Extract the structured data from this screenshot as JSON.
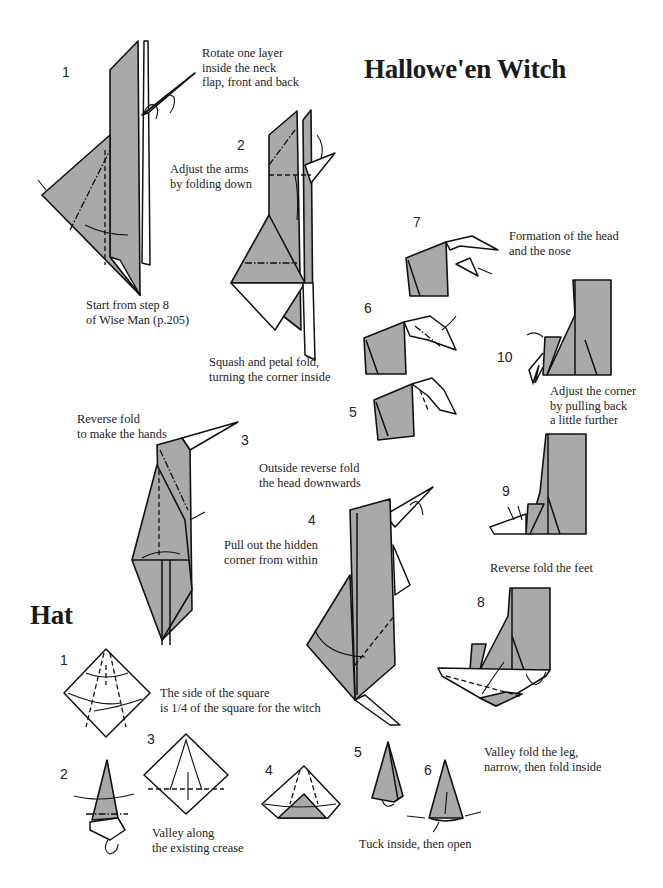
{
  "page": {
    "title": "Hallowe'en Witch",
    "accent_gray": "#a9a9a9",
    "line_color": "#111111"
  },
  "witch": {
    "steps": [
      {
        "number": "1",
        "caption": "Rotate one layer\ninside the neck\nflap, front and back"
      },
      {
        "number": "2",
        "caption": "Adjust the arms\nby folding down"
      },
      {
        "number": "3",
        "caption": "Reverse fold\nto make the hands"
      },
      {
        "number": "4",
        "caption": "Outside reverse fold\nthe head downwards"
      },
      {
        "number": "5",
        "caption": ""
      },
      {
        "number": "6",
        "caption": ""
      },
      {
        "number": "7",
        "caption": "Formation of the head\nand the nose"
      },
      {
        "number": "8",
        "caption": "Valley fold the leg,\nnarrow, then fold inside"
      },
      {
        "number": "9",
        "caption": "Reverse fold the feet"
      },
      {
        "number": "10",
        "caption": "Adjust the corner\nby pulling back\na little further"
      }
    ],
    "notes": {
      "start": "Start from step 8\nof Wise Man (p.205)",
      "squash": "Squash and petal fold,\nturning the corner inside",
      "pull_out": "Pull out the hidden\ncorner from within"
    }
  },
  "hat": {
    "title": "Hat",
    "steps": [
      {
        "number": "1",
        "caption": "The side of the square\nis 1/4 of the square for the witch"
      },
      {
        "number": "2",
        "caption": ""
      },
      {
        "number": "3",
        "caption": "Valley along\nthe existing crease"
      },
      {
        "number": "4",
        "caption": ""
      },
      {
        "number": "5",
        "caption": ""
      },
      {
        "number": "6",
        "caption": "Tuck inside, then open"
      }
    ]
  }
}
